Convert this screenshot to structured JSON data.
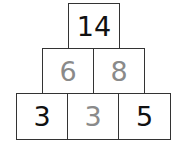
{
  "pyramid": {
    "rows": [
      [
        {
          "value": "14",
          "type": "given"
        }
      ],
      [
        {
          "value": "6",
          "type": "filled"
        },
        {
          "value": "8",
          "type": "filled"
        }
      ],
      [
        {
          "value": "3",
          "type": "given"
        },
        {
          "value": "3",
          "type": "filled"
        },
        {
          "value": "5",
          "type": "given"
        }
      ]
    ],
    "colors": {
      "given": "#111111",
      "filled": "#8a8a8a",
      "border": "#333333"
    }
  }
}
